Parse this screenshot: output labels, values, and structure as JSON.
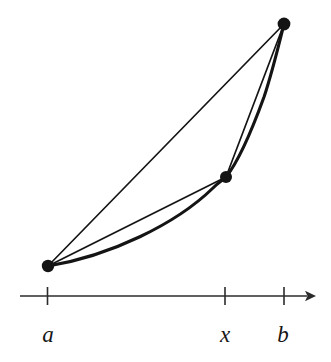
{
  "figure": {
    "background_color": "#ffffff",
    "ink_color": "#141414",
    "axis_color": "#2b2b2b"
  },
  "axis": {
    "name": "number-line",
    "y": 296,
    "x_start": 20,
    "x_end": 316,
    "arrow": "right-arrow",
    "stroke_width": 1.6,
    "ticks": [
      {
        "label": "a",
        "x": 47.5,
        "label_x": 48,
        "label_y": 342
      },
      {
        "label": "x",
        "x": 225,
        "label_x": 225,
        "label_y": 342
      },
      {
        "label": "b",
        "x": 284,
        "label_x": 283,
        "label_y": 342
      }
    ],
    "tick_half_height": 9
  },
  "points": [
    {
      "name": "point-a",
      "label": "a",
      "x": 48,
      "y": 266,
      "radius": 6.2
    },
    {
      "name": "point-x",
      "label": "x",
      "x": 226,
      "y": 177,
      "radius": 6.0
    },
    {
      "name": "point-b",
      "label": "b",
      "x": 284,
      "y": 24,
      "radius": 6.4
    }
  ],
  "curve": {
    "name": "convex-curve",
    "description": "Convex increasing curve passing through the three marked points",
    "stroke_width": 3.1,
    "path": "M 48 266 C 110 256 176 224 213 188 C 219 182 223 180 226 177 C 238 162 252 130 264 97 C 272 73 279 44 284 24"
  },
  "chords": [
    {
      "name": "chord-a-to-b",
      "from": "a",
      "to": "b",
      "x1": 48,
      "y1": 266,
      "x2": 284,
      "y2": 24,
      "stroke_width": 1.7
    },
    {
      "name": "chord-a-to-x",
      "from": "a",
      "to": "x",
      "x1": 48,
      "y1": 266,
      "x2": 226,
      "y2": 177,
      "stroke_width": 1.7
    },
    {
      "name": "chord-x-to-b",
      "from": "x",
      "to": "b",
      "x1": 226,
      "y1": 177,
      "x2": 284,
      "y2": 24,
      "stroke_width": 1.7
    }
  ],
  "chart_data": {
    "type": "line",
    "xlabel": "",
    "ylabel": "",
    "grid": false,
    "legend": null,
    "x_tick_labels": [
      "a",
      "x",
      "b"
    ],
    "x_tick_positions": [
      47.5,
      225,
      284
    ],
    "series": [
      {
        "name": "convex curve",
        "points": [
          [
            48,
            266
          ],
          [
            90,
            259
          ],
          [
            130,
            243
          ],
          [
            170,
            221
          ],
          [
            200,
            199
          ],
          [
            226,
            177
          ],
          [
            248,
            140
          ],
          [
            266,
            92
          ],
          [
            284,
            24
          ]
        ]
      },
      {
        "name": "chord a-b",
        "points": [
          [
            48,
            266
          ],
          [
            284,
            24
          ]
        ]
      },
      {
        "name": "chord a-x",
        "points": [
          [
            48,
            266
          ],
          [
            226,
            177
          ]
        ]
      },
      {
        "name": "chord x-b",
        "points": [
          [
            226,
            177
          ],
          [
            284,
            24
          ]
        ]
      }
    ],
    "marked_points": [
      {
        "label": "a",
        "x": 48,
        "y": 266
      },
      {
        "label": "x",
        "x": 226,
        "y": 177
      },
      {
        "label": "b",
        "x": 284,
        "y": 24
      }
    ]
  }
}
